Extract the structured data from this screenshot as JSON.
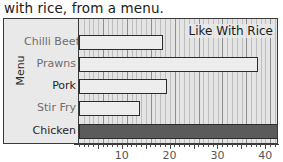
{
  "title": "with rice, from a menu.",
  "annotation": "Like With Rice",
  "axis": {
    "y_title": "Menu",
    "x_ticks": [
      {
        "label": "10",
        "value": 10
      },
      {
        "label": "20",
        "value": 20
      },
      {
        "label": "30",
        "value": 30
      },
      {
        "label": "40",
        "value": 40
      }
    ]
  },
  "colors": {
    "bar_light": "#ededed",
    "bar_dark": "#5b5b5b",
    "bar_outline": "#2b2b2b",
    "plot_background": "#e4e4e4",
    "frame_background": "#e9e9e9",
    "frame_border": "#3a3a3a",
    "gridline_minor": "#bdbdbd",
    "gridline_major": "#8e8e8e",
    "text": "#1f1f1f",
    "text_muted": "#6e6e6e"
  },
  "chart_data": {
    "type": "bar",
    "orientation": "horizontal",
    "title": "with rice, from a menu.",
    "xlabel": "",
    "ylabel": "Menu",
    "annotation": "Like With Rice",
    "categories": [
      "Chilli Beef",
      "Prawns",
      "Pork",
      "Stir Fry",
      "Chicken"
    ],
    "values": [
      17.5,
      37.5,
      18.5,
      12.7,
      42.5
    ],
    "xlim": [
      0,
      44
    ],
    "xticks": [
      10,
      20,
      30,
      40
    ],
    "minor_tick_step": 1,
    "major_tick_step": 5,
    "grid": true,
    "legend": false,
    "bar_styles": [
      "light",
      "light",
      "light",
      "light",
      "dark"
    ]
  }
}
